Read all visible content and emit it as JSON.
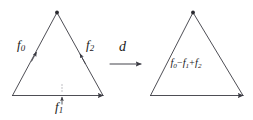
{
  "figure": {
    "type": "commutative-diagram",
    "stroke_color": "#3a3a42",
    "text_color": "#1a1a1a",
    "background_color": "#ffffff",
    "left_shape": {
      "name": "triangle",
      "edges": [
        {
          "id": "f0",
          "label": "f",
          "subscript": "0",
          "position": "left-edge",
          "orientation": "up-right"
        },
        {
          "id": "f1",
          "label": "f",
          "subscript": "1",
          "position": "bottom-edge",
          "orientation": "right"
        },
        {
          "id": "f2",
          "label": "f",
          "subscript": "2",
          "position": "right-edge",
          "orientation": "down-left"
        }
      ]
    },
    "operator": {
      "id": "d",
      "label": "d",
      "arrow": "right-arrow"
    },
    "right_shape": {
      "name": "triangle",
      "interior_label": {
        "terms": [
          {
            "label": "f",
            "subscript": "0",
            "operator": ""
          },
          {
            "label": "f",
            "subscript": "1",
            "operator": "−"
          },
          {
            "label": "f",
            "subscript": "2",
            "operator": "+"
          }
        ],
        "plain_text": "f0−f1+f2"
      }
    }
  }
}
